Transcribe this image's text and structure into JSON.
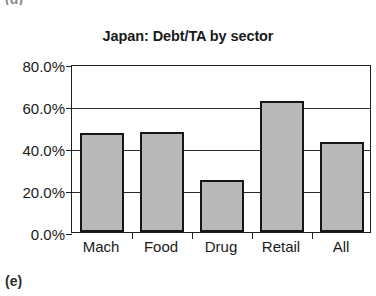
{
  "figure": {
    "panel_letter_top": "(d)",
    "panel_letter_bottom": "(e)"
  },
  "colors": {
    "bar_fill": "#b9b9b9",
    "bar_border": "#161616",
    "axis": "#1f1f1f",
    "text": "#1a1a1a",
    "background": "#ffffff"
  },
  "chart_data": {
    "type": "bar",
    "title": "Japan: Debt/TA by sector",
    "xlabel": "",
    "ylabel": "",
    "categories": [
      "Mach",
      "Food",
      "Drug",
      "Retail",
      "All"
    ],
    "values": [
      47.0,
      47.5,
      24.8,
      62.5,
      43.0
    ],
    "value_labels": [
      "47.0%",
      "47.5%",
      "24.8%",
      "62.5%",
      "43.0%"
    ],
    "ylim": [
      0,
      80
    ],
    "ytick_values": [
      0,
      20,
      40,
      60,
      80
    ],
    "ytick_labels": [
      "0.0%",
      "20.0%",
      "40.0%",
      "60.0%",
      "80.0%"
    ],
    "grid": true,
    "grid_axis": "y",
    "legend": null,
    "legend_position": "none",
    "series": [
      {
        "name": "Debt/TA",
        "values": [
          47.0,
          47.5,
          24.8,
          62.5,
          43.0
        ]
      }
    ]
  }
}
